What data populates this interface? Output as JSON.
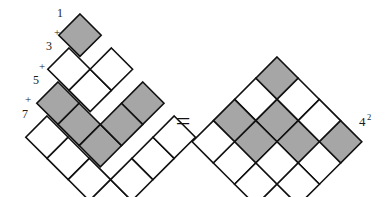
{
  "figure": {
    "equals_sign": "=",
    "plus_sign": "+",
    "colors": {
      "shaded_fill": "#a6a6a6",
      "plain_fill": "#ffffff",
      "stroke": "#111111",
      "background": "#ffffff",
      "text": "#1a1a1a"
    }
  },
  "left_figure": {
    "name": "nested-gnomons",
    "description": "Four nested L-shaped gnomons rotated 45 degrees, of sizes 1, 3, 5 and 7 cells",
    "cell_size": 30,
    "labels": [
      {
        "id": "label-1",
        "text": "1"
      },
      {
        "id": "plus-1",
        "text": "+"
      },
      {
        "id": "label-3",
        "text": "3"
      },
      {
        "id": "plus-2",
        "text": "+"
      },
      {
        "id": "label-5",
        "text": "5"
      },
      {
        "id": "plus-3",
        "text": "+"
      },
      {
        "id": "label-7",
        "text": "7"
      }
    ],
    "gnomons": [
      {
        "index": 0,
        "count": 1,
        "label": "1",
        "shaded": true,
        "cells": [
          [
            0,
            0
          ]
        ]
      },
      {
        "index": 1,
        "count": 3,
        "label": "3",
        "shaded": false,
        "cells": [
          [
            1,
            0
          ],
          [
            1,
            1
          ],
          [
            0,
            1
          ]
        ]
      },
      {
        "index": 2,
        "count": 5,
        "label": "5",
        "shaded": true,
        "cells": [
          [
            2,
            0
          ],
          [
            2,
            1
          ],
          [
            2,
            2
          ],
          [
            1,
            2
          ],
          [
            0,
            2
          ]
        ]
      },
      {
        "index": 3,
        "count": 7,
        "label": "7",
        "shaded": false,
        "cells": [
          [
            3,
            0
          ],
          [
            3,
            1
          ],
          [
            3,
            2
          ],
          [
            3,
            3
          ],
          [
            2,
            3
          ],
          [
            1,
            3
          ],
          [
            0,
            3
          ]
        ]
      }
    ]
  },
  "right_figure": {
    "name": "square-grid",
    "description": "Solid 4 by 4 grid of cells rotated 45 degrees forming a diamond",
    "cell_size": 30,
    "rows": 4,
    "cols": 4,
    "shaded_map": [
      [
        true,
        false,
        false,
        true
      ],
      [
        false,
        true,
        true,
        false
      ],
      [
        true,
        true,
        false,
        false
      ],
      [
        false,
        false,
        false,
        false
      ]
    ],
    "result": {
      "base": "4",
      "exponent": "2",
      "full": "4²"
    }
  }
}
